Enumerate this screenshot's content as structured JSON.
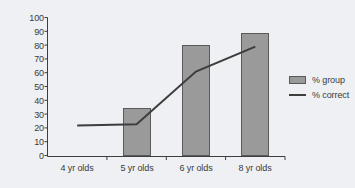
{
  "chart_data": {
    "type": "bar",
    "title": "",
    "xlabel": "",
    "ylabel": "",
    "ylim": [
      0,
      100
    ],
    "yticks": [
      "0",
      "10",
      "20",
      "30",
      "40",
      "50",
      "60",
      "70",
      "80",
      "90",
      "100"
    ],
    "grid": false,
    "legend_position": "right",
    "categories": [
      "4 yr olds",
      "5 yr olds",
      "6 yr olds",
      "8 yr olds"
    ],
    "series": [
      {
        "name": "% group",
        "render": "bar",
        "color": "#9a9a9a",
        "values": [
          0,
          35,
          80,
          89
        ]
      },
      {
        "name": "% correct",
        "render": "line",
        "color": "#3d3d3d",
        "values": [
          22,
          23,
          61,
          79
        ]
      }
    ]
  },
  "axis": {
    "y_ticks": [
      {
        "label": "100",
        "value": 100
      },
      {
        "label": "90",
        "value": 90
      },
      {
        "label": "80",
        "value": 80
      },
      {
        "label": "70",
        "value": 70
      },
      {
        "label": "60",
        "value": 60
      },
      {
        "label": "50",
        "value": 50
      },
      {
        "label": "40",
        "value": 40
      },
      {
        "label": "30",
        "value": 30
      },
      {
        "label": "20",
        "value": 20
      },
      {
        "label": "10",
        "value": 10
      },
      {
        "label": "0",
        "value": 0
      }
    ],
    "x_ticks": [
      {
        "label": "4 yr olds"
      },
      {
        "label": "5 yr olds"
      },
      {
        "label": "6 yr olds"
      },
      {
        "label": "8 yr olds"
      }
    ]
  },
  "legend": {
    "entries": [
      {
        "label": "% group",
        "marker": "bar-swatch-icon"
      },
      {
        "label": "% correct",
        "marker": "line-swatch-icon"
      }
    ]
  },
  "colors": {
    "background": "#eef0f3",
    "bar_fill": "#9a9a9a",
    "bar_stroke": "#5a5a5a",
    "line": "#3d3d3d",
    "axis": "#3d3d3d",
    "text": "#3a3a3a"
  }
}
